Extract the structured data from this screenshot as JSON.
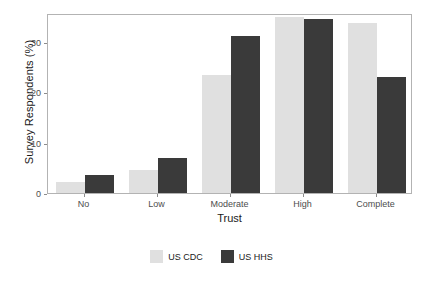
{
  "chart_data": {
    "type": "bar",
    "title": "",
    "xlabel": "Trust",
    "ylabel": "Survey Respondents (%)",
    "categories": [
      "No",
      "Low",
      "Moderate",
      "High",
      "Complete"
    ],
    "series": [
      {
        "name": "US CDC",
        "color": "#e0e0e0",
        "values": [
          2.1,
          4.6,
          23.4,
          35.0,
          33.8
        ]
      },
      {
        "name": "US HHS",
        "color": "#3a3a3a",
        "values": [
          3.5,
          7.0,
          31.2,
          34.6,
          23.1
        ]
      }
    ],
    "ylim": [
      0,
      35.8
    ],
    "yticks": [
      0,
      10,
      20,
      30
    ],
    "ytick_labels": [
      "0",
      "10",
      "20",
      "30"
    ],
    "grid": false,
    "legend_position": "bottom",
    "panel_border_color": "#b3b3b3",
    "background_color": "#ffffff"
  }
}
